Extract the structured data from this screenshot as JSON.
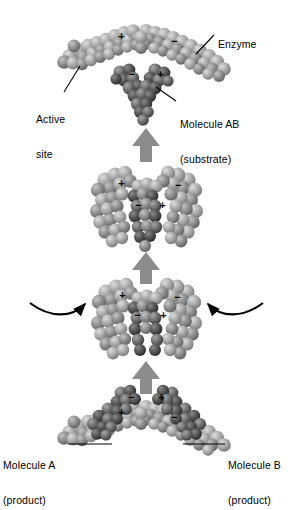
{
  "figure": {
    "type": "biology-diagram",
    "background_color": "#ffffff",
    "ink_color": "#000000",
    "arrow_color": "#8c8c8c",
    "enzyme_color": "#a8a8a8",
    "substrate_color": "#6e6e6e"
  },
  "labels": {
    "enzyme": {
      "line1": "Enzyme",
      "line2": ""
    },
    "active_site": {
      "line1": "Active",
      "line2": "site"
    },
    "substrate": {
      "line1": "Molecule AB",
      "line2": "(substrate)"
    },
    "product_a": {
      "line1": "Molecule A",
      "line2": "(product)"
    },
    "product_b": {
      "line1": "Molecule B",
      "line2": "(product)"
    }
  },
  "charges": {
    "plus": "+",
    "minus": "−"
  },
  "panels": [
    {
      "id": "panel-1-approach",
      "order": 1,
      "caption": "Enzyme and substrate approach",
      "enzyme_charges": [
        "+",
        "−"
      ],
      "substrate_charges": [
        "−",
        "+"
      ]
    },
    {
      "id": "panel-2-complex",
      "order": 2,
      "caption": "Enzyme-substrate complex forms",
      "enzyme_charges": [
        "+",
        "−"
      ],
      "substrate_charges": [
        "−",
        "+"
      ]
    },
    {
      "id": "panel-3-strain",
      "order": 3,
      "caption": "Induced fit strains the substrate bond",
      "enzyme_charges": [
        "+",
        "−"
      ],
      "substrate_charges": [
        "−",
        "+"
      ]
    },
    {
      "id": "panel-4-release",
      "order": 4,
      "caption": "Products released, enzyme unchanged",
      "enzyme_charges": [
        "+",
        "−"
      ],
      "substrate_charges": [
        "−",
        "+"
      ]
    }
  ],
  "arrows": {
    "up_1": "up-block-arrow",
    "up_2": "up-block-arrow",
    "up_3": "up-block-arrow",
    "curve_left": "curved-arrow-right",
    "curve_right": "curved-arrow-left"
  }
}
